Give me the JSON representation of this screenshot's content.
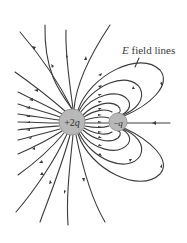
{
  "diagram": {
    "label": {
      "text_italic": "E",
      "text_rest": " field lines"
    },
    "charges": [
      {
        "id": "positive",
        "label": "+2q",
        "display_sign": "+2",
        "display_var": "q",
        "cx": 72,
        "cy": 122,
        "r": 13,
        "fill": "#b8b8b8"
      },
      {
        "id": "negative",
        "label": "−q",
        "display_sign": "−",
        "display_var": "q",
        "cx": 118,
        "cy": 122,
        "r": 9,
        "fill": "#b8b8b8"
      }
    ],
    "colors": {
      "line": "#3c3c3c",
      "charge_fill": "#b8b8b8",
      "charge_stroke": "#8a8a8a",
      "text": "#3a3a3a",
      "background": "#ffffff"
    }
  }
}
